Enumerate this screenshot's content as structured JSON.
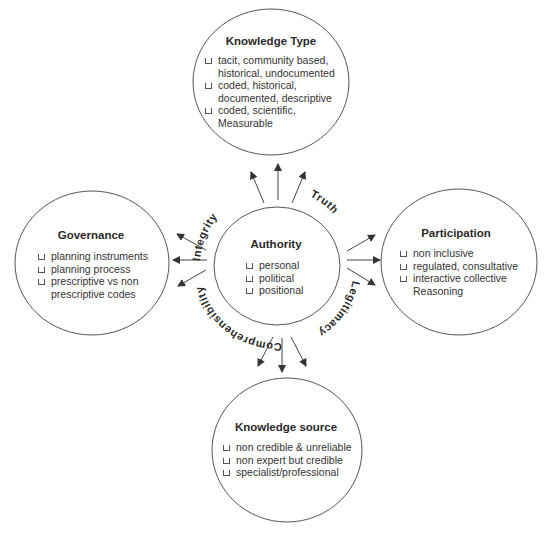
{
  "center": {
    "title": "Authority",
    "items": [
      "personal",
      "political",
      "positional"
    ]
  },
  "nodes": {
    "top": {
      "title": "Knowledge Type",
      "items": [
        "tacit, community based,\nhistorical, undocumented",
        "coded, historical,\ndocumented, descriptive",
        "coded, scientific,\nMeasurable"
      ]
    },
    "left": {
      "title": "Governance",
      "items": [
        "planning instruments",
        "planning process",
        "prescriptive vs non\nprescriptive codes"
      ]
    },
    "right": {
      "title": "Participation",
      "items": [
        "non inclusive",
        "regulated, consultative",
        "interactive collective\nReasoning"
      ]
    },
    "bottom": {
      "title": "Knowledge source",
      "items": [
        "non credible & unreliable",
        "non expert but credible",
        "specialist/professional"
      ]
    }
  },
  "arc_labels": {
    "integrity": "Integrity",
    "truth": "Truth",
    "legitimacy": "Legitimacy",
    "comprehensibility": "Comprehensibility"
  },
  "colors": {
    "stroke": "#444444",
    "text": "#222222"
  }
}
